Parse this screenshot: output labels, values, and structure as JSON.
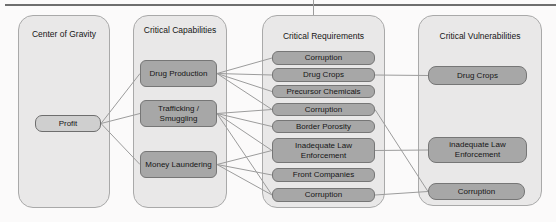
{
  "diagram": {
    "columns": [
      {
        "title": "Center of Gravity"
      },
      {
        "title": "Critical Capabilities"
      },
      {
        "title": "Critical Requirements"
      },
      {
        "title": "Critical Vulnerabilities"
      }
    ],
    "nodes": {
      "profit": {
        "label": "Profit"
      },
      "drug_production": {
        "label": "Drug Production"
      },
      "trafficking_smuggling": {
        "label": "Trafficking / Smuggling"
      },
      "money_laundering": {
        "label": "Money Laundering"
      },
      "req_corruption_1": {
        "label": "Corruption"
      },
      "req_drug_crops": {
        "label": "Drug Crops"
      },
      "req_precursor_chemicals": {
        "label": "Precursor Chemicals"
      },
      "req_corruption_2": {
        "label": "Corruption"
      },
      "req_border_porosity": {
        "label": "Border Porosity"
      },
      "req_inadequate_law": {
        "label": "Inadequate Law Enforcement"
      },
      "req_front_companies": {
        "label": "Front Companies"
      },
      "req_corruption_3": {
        "label": "Corruption"
      },
      "vul_drug_crops": {
        "label": "Drug Crops"
      },
      "vul_inadequate_law": {
        "label": "inadequate Law Enforcement"
      },
      "vul_corruption": {
        "label": "Corruption"
      }
    },
    "edges": [
      {
        "from": "profit",
        "to": "drug_production"
      },
      {
        "from": "profit",
        "to": "trafficking_smuggling"
      },
      {
        "from": "profit",
        "to": "money_laundering"
      },
      {
        "from": "drug_production",
        "to": "req_corruption_1"
      },
      {
        "from": "drug_production",
        "to": "req_drug_crops"
      },
      {
        "from": "drug_production",
        "to": "req_precursor_chemicals"
      },
      {
        "from": "drug_production",
        "to": "req_corruption_2"
      },
      {
        "from": "trafficking_smuggling",
        "to": "req_corruption_2"
      },
      {
        "from": "trafficking_smuggling",
        "to": "req_border_porosity"
      },
      {
        "from": "trafficking_smuggling",
        "to": "req_inadequate_law"
      },
      {
        "from": "trafficking_smuggling",
        "to": "req_corruption_3"
      },
      {
        "from": "money_laundering",
        "to": "req_inadequate_law"
      },
      {
        "from": "money_laundering",
        "to": "req_front_companies"
      },
      {
        "from": "money_laundering",
        "to": "req_corruption_3"
      },
      {
        "from": "req_drug_crops",
        "to": "vul_drug_crops"
      },
      {
        "from": "req_inadequate_law",
        "to": "vul_inadequate_law"
      },
      {
        "from": "req_corruption_2",
        "to": "vul_corruption"
      },
      {
        "from": "req_corruption_3",
        "to": "vul_corruption"
      }
    ],
    "colors": {
      "column_fill": "#e9e8e8",
      "column_border": "#a9a9a9",
      "node_fill": "#a7a7a7",
      "node_border": "#767676",
      "cog_node_fill": "#cfcfcf",
      "connector": "#9c9c9c",
      "top_rule": "#6e6e6e",
      "text": "#1c1c1c"
    }
  }
}
